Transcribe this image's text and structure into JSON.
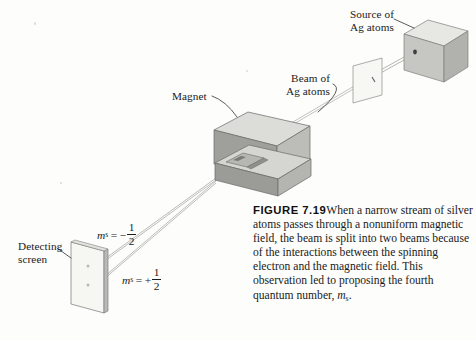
{
  "figure": {
    "number_label": "FIGURE 7.19",
    "caption_text": "When a narrow stream of silver atoms passes through a nonuniform magnetic field, the beam is split into two beams because of the interactions between the spinning electron and the magnetic field. This observation led to proposing the fourth quantum number, ",
    "caption_tail_symbol": "m",
    "caption_tail_subscript": "s",
    "caption_tail_period": "."
  },
  "labels": {
    "source": {
      "line1": "Source of",
      "line2": "Ag atoms"
    },
    "beam": {
      "line1": "Beam of",
      "line2": "Ag atoms"
    },
    "magnet": "Magnet",
    "screen": {
      "line1": "Detecting",
      "line2": "screen"
    }
  },
  "quantum_numbers": {
    "upper": {
      "symbol": "m",
      "subscript": "s",
      "equals": "=",
      "sign": "−",
      "numerator": "1",
      "denominator": "2"
    },
    "lower": {
      "symbol": "m",
      "subscript": "s",
      "equals": "=",
      "sign": "+",
      "numerator": "1",
      "denominator": "2"
    }
  },
  "colors": {
    "page_background": "#fdfdfc",
    "ink": "#1b1b1b",
    "leader_line": "#3d3d3d",
    "beam_line": "#9a9a96",
    "block_top": "#dcdcd8",
    "block_front": "#9e9e9a",
    "block_side": "#b8b8b4",
    "cube_top": "#e6e6e2",
    "cube_front": "#c9c9c5",
    "cube_side": "#b0b0ac",
    "screen_face": "#f4f4f1",
    "screen_edge": "#8d8d89",
    "aperture": "#4a4a48"
  },
  "apparatus": {
    "source_oven": "oven-cube",
    "collimator": "slit-plate",
    "magnet_poles": 2,
    "detecting_screen_spots": 2,
    "beam_count_after_split": 2
  }
}
